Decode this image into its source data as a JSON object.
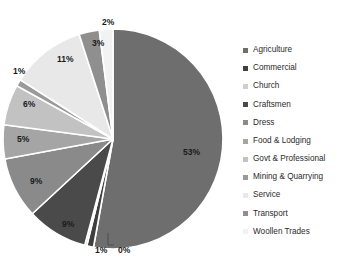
{
  "chart_data": {
    "type": "pie",
    "title": "",
    "subtitle": "",
    "xlabel": "",
    "ylabel": "",
    "legend_position": "right",
    "grid": false,
    "start_angle_deg": 0,
    "direction": "clockwise",
    "categories": [
      "Agriculture",
      "Commercial",
      "Church",
      "Craftsmen",
      "Dress",
      "Food & Lodging",
      "Govt & Professional",
      "Mining & Quarrying",
      "Service",
      "Transport",
      "Woollen Trades"
    ],
    "values": [
      53,
      1,
      0,
      9,
      9,
      5,
      6,
      1,
      11,
      3,
      2
    ],
    "data_labels": [
      "53%",
      "1%",
      "0%",
      "9%",
      "9%",
      "5%",
      "6%",
      "1%",
      "11%",
      "3%",
      "2%"
    ],
    "colors": [
      "#6e6e6e",
      "#3f3f3f",
      "#cfcfcf",
      "#4a4a4a",
      "#8a8a8a",
      "#a5a5a5",
      "#c2c2c2",
      "#9a9a9a",
      "#e8e8e8",
      "#8f8f8f",
      "#f2f2f2"
    ],
    "slice_border_color": "#ffffff",
    "slices": [
      {
        "label": "Agriculture",
        "value": 53,
        "data_label": "53%",
        "color": "#6e6e6e"
      },
      {
        "label": "Commercial",
        "value": 1,
        "data_label": "1%",
        "color": "#3f3f3f"
      },
      {
        "label": "Church",
        "value": 0,
        "data_label": "0%",
        "color": "#cfcfcf"
      },
      {
        "label": "Craftsmen",
        "value": 9,
        "data_label": "9%",
        "color": "#4a4a4a"
      },
      {
        "label": "Dress",
        "value": 9,
        "data_label": "9%",
        "color": "#8a8a8a"
      },
      {
        "label": "Food & Lodging",
        "value": 5,
        "data_label": "5%",
        "color": "#a5a5a5"
      },
      {
        "label": "Govt & Professional",
        "value": 6,
        "data_label": "6%",
        "color": "#c2c2c2"
      },
      {
        "label": "Mining & Quarrying",
        "value": 1,
        "data_label": "1%",
        "color": "#9a9a9a"
      },
      {
        "label": "Service",
        "value": 11,
        "data_label": "11%",
        "color": "#e8e8e8"
      },
      {
        "label": "Transport",
        "value": 3,
        "data_label": "3%",
        "color": "#8f8f8f"
      },
      {
        "label": "Woollen Trades",
        "value": 2,
        "data_label": "2%",
        "color": "#f2f2f2"
      }
    ]
  },
  "labels": {
    "pct_agriculture": "53%",
    "pct_commercial": "1%",
    "pct_church": "0%",
    "pct_craftsmen": "9%",
    "pct_dress": "9%",
    "pct_food_lodging": "5%",
    "pct_govt_professional": "6%",
    "pct_mining_quarrying": "1%",
    "pct_service": "11%",
    "pct_transport": "3%",
    "pct_woollen_trades": "2%"
  },
  "legend": {
    "items": [
      {
        "label": "Agriculture",
        "color": "#6e6e6e"
      },
      {
        "label": "Commercial",
        "color": "#3f3f3f"
      },
      {
        "label": "Church",
        "color": "#cfcfcf"
      },
      {
        "label": "Craftsmen",
        "color": "#4a4a4a"
      },
      {
        "label": "Dress",
        "color": "#8a8a8a"
      },
      {
        "label": "Food & Lodging",
        "color": "#a5a5a5"
      },
      {
        "label": "Govt & Professional",
        "color": "#c2c2c2"
      },
      {
        "label": "Mining & Quarrying",
        "color": "#9a9a9a"
      },
      {
        "label": "Service",
        "color": "#e8e8e8"
      },
      {
        "label": "Transport",
        "color": "#8f8f8f"
      },
      {
        "label": "Woollen Trades",
        "color": "#f2f2f2"
      }
    ]
  }
}
